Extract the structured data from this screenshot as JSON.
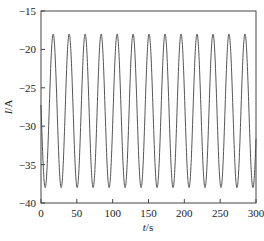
{
  "chart_data": {
    "type": "line",
    "title": "",
    "xlabel": "t/s",
    "xlabel_var": "t",
    "xlabel_unit": "/s",
    "ylabel": "I/A",
    "ylabel_var": "I",
    "ylabel_unit": "/A",
    "xlim": [
      0,
      300
    ],
    "ylim": [
      -40,
      -15
    ],
    "xticks": [
      0,
      50,
      100,
      150,
      200,
      250,
      300
    ],
    "yticks": [
      -40,
      -35,
      -30,
      -25,
      -20,
      -15
    ],
    "xtick_labels": [
      "0",
      "50",
      "100",
      "150",
      "200",
      "250",
      "300"
    ],
    "ytick_labels": [
      "-40",
      "-35",
      "-30",
      "-25",
      "-20",
      "-15"
    ],
    "grid": false,
    "legend": null,
    "series": [
      {
        "name": "I(t)",
        "color": "#555555",
        "model": "sinusoid",
        "mean": -28,
        "amplitude": 10,
        "period": 22.3,
        "first_peak_t": 17,
        "peak_value": -18,
        "trough_value": -38,
        "num_peaks": 13,
        "peaks_t": [
          17,
          39.3,
          61.6,
          83.9,
          106.2,
          128.5,
          150.8,
          173.1,
          195.4,
          217.7,
          240,
          262.3,
          284.6
        ],
        "troughs_t": [
          5.9,
          28.2,
          50.5,
          72.8,
          95.1,
          117.4,
          139.7,
          162,
          184.3,
          206.6,
          228.9,
          251.2,
          273.5,
          295.8
        ]
      }
    ]
  },
  "colors": {
    "axis": "#444444",
    "line": "#555555",
    "text": "#222222"
  }
}
